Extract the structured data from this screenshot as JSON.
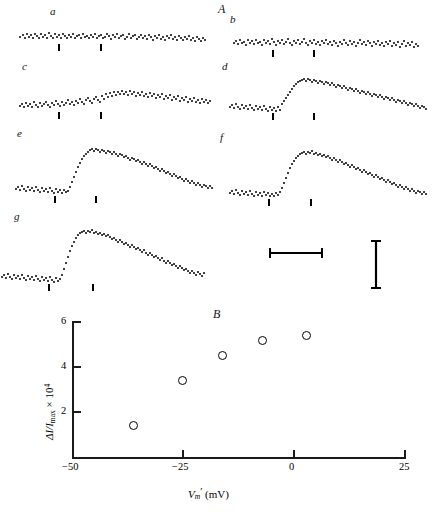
{
  "figure": {
    "panel_A_label": "A",
    "panel_B_label": "B",
    "trace_labels": [
      "a",
      "b",
      "c",
      "d",
      "e",
      "f",
      "g"
    ],
    "scalebars": {
      "horizontal_name": "time-scale-bar",
      "vertical_name": "amplitude-scale-bar"
    }
  },
  "chart_data": {
    "type": "scatter",
    "title": "B",
    "xlabel": "Vₘ′ (mV)",
    "ylabel": "ΔI/I max × 10⁴",
    "xlim": [
      -50,
      25
    ],
    "ylim": [
      0,
      6
    ],
    "xticks": [
      -50,
      -25,
      0,
      25
    ],
    "xticklabels": [
      "−50",
      "−25",
      "0",
      "25"
    ],
    "yticks": [
      2,
      4,
      6
    ],
    "yticklabels": [
      "2",
      "4",
      "6"
    ],
    "grid": false,
    "legend": "none",
    "marker": "open-circle",
    "x": [
      -36,
      -25,
      -16,
      -7,
      3
    ],
    "y": [
      1.4,
      3.4,
      4.5,
      5.15,
      5.4
    ],
    "points": [
      {
        "x": -36,
        "y": 1.4
      },
      {
        "x": -25,
        "y": 3.4
      },
      {
        "x": -16,
        "y": 4.5
      },
      {
        "x": -7,
        "y": 5.15
      },
      {
        "x": 3,
        "y": 5.4
      }
    ]
  },
  "traces": {
    "a": {
      "label": "a",
      "description": "flat noisy baseline, no response"
    },
    "b": {
      "label": "b",
      "description": "flat noisy baseline, no response"
    },
    "c": {
      "label": "c",
      "description": "small slow rise and decay"
    },
    "d": {
      "label": "d",
      "description": "moderate rise and decay"
    },
    "e": {
      "label": "e",
      "description": "large fast rise, slow decay"
    },
    "f": {
      "label": "f",
      "description": "large fast rise, slow decay"
    },
    "g": {
      "label": "g",
      "description": "largest fast rise, slow decay"
    }
  },
  "yaxis_label_parts": {
    "delta_i": "ΔI/I",
    "max": "max",
    "times": "× 10",
    "exponent": "4"
  },
  "xaxis_label_parts": {
    "v": "V",
    "m": "m",
    "prime": "′",
    "unit": "(mV)"
  }
}
